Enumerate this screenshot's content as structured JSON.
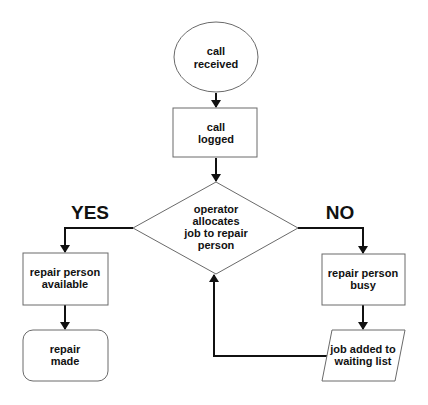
{
  "diagram": {
    "type": "flowchart",
    "nodes": {
      "start": {
        "shape": "ellipse",
        "lines": [
          "call",
          "received"
        ]
      },
      "logged": {
        "shape": "rectangle",
        "lines": [
          "call",
          "logged"
        ]
      },
      "decision": {
        "shape": "diamond",
        "lines": [
          "operator",
          "allocates",
          "job to repair",
          "person"
        ]
      },
      "available": {
        "shape": "rectangle",
        "lines": [
          "repair person",
          "available"
        ]
      },
      "made": {
        "shape": "rounded-rectangle",
        "lines": [
          "repair",
          "made"
        ]
      },
      "busy": {
        "shape": "rectangle",
        "lines": [
          "repair person",
          "busy"
        ]
      },
      "waiting": {
        "shape": "parallelogram",
        "lines": [
          "job added to",
          "waiting list"
        ]
      }
    },
    "branch_labels": {
      "yes": "YES",
      "no": "NO"
    },
    "edges": [
      {
        "from": "start",
        "to": "logged"
      },
      {
        "from": "logged",
        "to": "decision"
      },
      {
        "from": "decision",
        "to": "available",
        "label": "YES"
      },
      {
        "from": "available",
        "to": "made"
      },
      {
        "from": "decision",
        "to": "busy",
        "label": "NO"
      },
      {
        "from": "busy",
        "to": "waiting"
      },
      {
        "from": "waiting",
        "to": "decision"
      }
    ]
  }
}
